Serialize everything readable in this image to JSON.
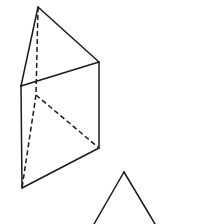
{
  "diagram": {
    "type": "geometric-line-drawing",
    "canvas": {
      "width": 205,
      "height": 224,
      "background": "#ffffff"
    },
    "stroke_color": "#1a1a1a",
    "shapes": [
      {
        "name": "triangular-prism",
        "vertices": {
          "apex_top": [
            38,
            7
          ],
          "top_right": [
            99,
            62
          ],
          "mid_left": [
            21,
            86
          ],
          "hidden_inner": [
            36,
            95
          ],
          "bottom_right": [
            99,
            148
          ],
          "bottom_left": [
            22,
            188
          ]
        },
        "visible_edges": [
          [
            "apex_top",
            "mid_left"
          ],
          [
            "apex_top",
            "top_right"
          ],
          [
            "mid_left",
            "top_right"
          ],
          [
            "mid_left",
            "bottom_left"
          ],
          [
            "top_right",
            "bottom_right"
          ],
          [
            "bottom_left",
            "bottom_right"
          ]
        ],
        "hidden_edges": [
          [
            "apex_top",
            "hidden_inner"
          ],
          [
            "hidden_inner",
            "bottom_right"
          ],
          [
            "hidden_inner",
            "bottom_left"
          ]
        ]
      },
      {
        "name": "partial-triangle",
        "vertices": {
          "apex": [
            124,
            172
          ],
          "bottom_left_exit": [
            94,
            224
          ],
          "bottom_right_exit": [
            155,
            224
          ]
        },
        "visible_edges": [
          [
            "apex",
            "bottom_left_exit"
          ],
          [
            "apex",
            "bottom_right_exit"
          ]
        ],
        "hidden_edges": []
      }
    ]
  }
}
